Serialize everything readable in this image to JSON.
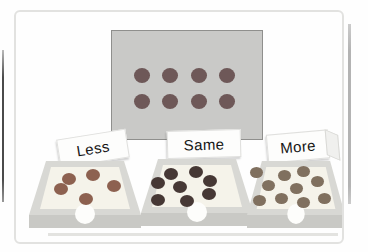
{
  "figure": {
    "type": "counting-comparison-activity"
  },
  "palette": {
    "panel_border": "#e2e2e0",
    "card_bg": "#c9c9c7",
    "tray_rim": "#d8d8d4",
    "tray_interior": "#f5f3ea",
    "tray_front": "#c9c9c5"
  },
  "stimulus_card": {
    "dot_count": 8,
    "rows": 2,
    "cols": 4,
    "dots": {
      "w": 16,
      "h": 15,
      "color": "#6e5858",
      "points": [
        [
          30,
          44
        ],
        [
          58,
          44
        ],
        [
          87,
          44
        ],
        [
          115,
          44
        ],
        [
          30,
          70
        ],
        [
          58,
          70
        ],
        [
          87,
          70
        ],
        [
          115,
          70
        ]
      ]
    }
  },
  "trays": [
    {
      "label": "Less",
      "dot_count": 5,
      "dots": {
        "w": 14,
        "h": 12,
        "color": "#8d6150",
        "points": [
          [
            40,
            19
          ],
          [
            64,
            15
          ],
          [
            32,
            29
          ],
          [
            85,
            26
          ],
          [
            57,
            39
          ]
        ]
      }
    },
    {
      "label": "Same",
      "dot_count": 8,
      "dots": {
        "w": 14,
        "h": 12,
        "color": "#463835",
        "points": [
          [
            30,
            16
          ],
          [
            55,
            14
          ],
          [
            17,
            25
          ],
          [
            39,
            29
          ],
          [
            69,
            23
          ],
          [
            17,
            42
          ],
          [
            46,
            43
          ],
          [
            68,
            36
          ]
        ]
      }
    },
    {
      "label": "More",
      "dot_count": 10,
      "dots": {
        "w": 13,
        "h": 11,
        "color": "#80705f",
        "points": [
          [
            9,
            12
          ],
          [
            37,
            15
          ],
          [
            56,
            11
          ],
          [
            21,
            25
          ],
          [
            49,
            28
          ],
          [
            70,
            21
          ],
          [
            12,
            40
          ],
          [
            34,
            38
          ],
          [
            56,
            42
          ],
          [
            77,
            38
          ]
        ]
      }
    }
  ]
}
